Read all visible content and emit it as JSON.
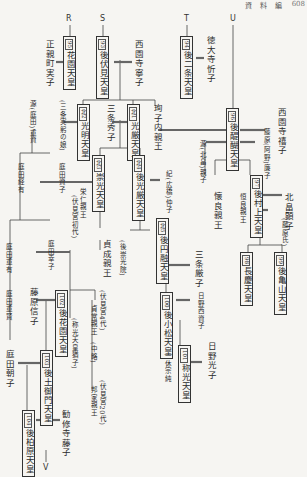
{
  "header": {
    "section": "資 料 編",
    "page": "608"
  },
  "markers": {
    "R": "R",
    "S": "S",
    "T": "T",
    "U": "U",
    "V": "V"
  },
  "emperors": [
    {
      "id": "hanazono",
      "num": "95",
      "name": "花園天皇"
    },
    {
      "id": "gofushimi",
      "num": "93",
      "name": "後伏見天皇"
    },
    {
      "id": "gonijo",
      "num": "94",
      "name": "後二条天皇"
    },
    {
      "id": "komyo",
      "num": "北2",
      "name": "光明天皇"
    },
    {
      "id": "kogon",
      "num": "北1",
      "name": "光厳天皇"
    },
    {
      "id": "godaigo",
      "num": "96",
      "name": "後醍醐天皇"
    },
    {
      "id": "suko",
      "num": "北3",
      "name": "崇光天皇"
    },
    {
      "id": "gokogon",
      "num": "北4",
      "name": "後光厳天皇"
    },
    {
      "id": "gomurakami",
      "num": "97",
      "name": "後村上天皇"
    },
    {
      "id": "goenyu",
      "num": "北5",
      "name": "後円融天皇"
    },
    {
      "id": "chokei",
      "num": "98",
      "name": "長慶天皇"
    },
    {
      "id": "gokameyama",
      "num": "99",
      "name": "後亀山天皇"
    },
    {
      "id": "gokomatsu",
      "num": "100",
      "name": "後小松天皇"
    },
    {
      "id": "shoko",
      "num": "101",
      "name": "称光天皇"
    },
    {
      "id": "gohanazono",
      "num": "102",
      "name": "後花園天皇"
    },
    {
      "id": "gotsuchimikado",
      "num": "103",
      "name": "後土御門天皇"
    },
    {
      "id": "gokashiwabara",
      "num": "104",
      "name": "後柏原天皇"
    }
  ],
  "persons": {
    "ogimachi_saneko": "正親町実子",
    "saionji_neiko": "西園寺寧子",
    "tokudaiji_kinko": "徳大寺忻子",
    "sanjo_saneaki_musume": "(三条実躬の娘)",
    "sanjo_hideko": "三条秀子",
    "junshi": "珣子内親王",
    "saionji_kishi": "西園寺禧子",
    "minamoto_shigesuke": "源(庭田)重資",
    "minamoto_renshi": "源(北畠)親子",
    "fujiwara_renshi": "藤原(阿野)廉子",
    "niwata_tsunemasa": "庭田経有",
    "niwata_sukeko": "庭田資子",
    "yoshihito": "栄仁親王",
    "fushiminomiya1": "(伏見宮初代)",
    "kanenaga": "懐良親王",
    "tsuneyoshi": "恒良親王",
    "kitabatake_akiko": "北畠顕子",
    "fujiwara_shi": "(藤原氏)",
    "ki_nakako": "紀(広橋)仲子",
    "sadafusa": "貞成親王",
    "gosukoin": "(後崇光院)",
    "sanjo_itsuko": "三条厳子",
    "niwata_shigeari": "庭田重有",
    "niwata_sachiko": "庭田幸子",
    "hino_sukeko": "日野西資子",
    "sadatsune_kakko": "(伏見宮4代)",
    "sadatsune": "貞常親王",
    "ikkyu": "一休宗純",
    "hino_mitsuko": "日野光子",
    "fujiwara_nobuko": "藤原信子",
    "kanemitsu_note": "(称光天皇猶子)",
    "niwata_shigemasa": "庭田重賢",
    "chu_ryaku": "(中略)",
    "fushiminomiya20": "(伏見宮20代)",
    "kuniie": "邦家親王",
    "niwata_asako": "庭田朝子",
    "kajuji_fujiko": "勧修寺藤子"
  }
}
